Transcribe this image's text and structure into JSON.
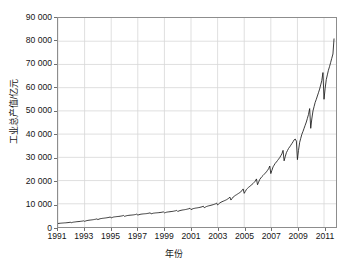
{
  "chart_data": {
    "type": "line",
    "title": "",
    "subtitle": "",
    "xlabel": "年份",
    "ylabel": "工业总产值/亿元",
    "xlim": [
      1991.0,
      2011.9
    ],
    "ylim": [
      0,
      90000
    ],
    "grid": true,
    "legend": null,
    "legend_position": "none",
    "line_color": "#1a1a1a",
    "grid_color": "#d7d7d7",
    "frame_color": "#8d8d8d",
    "background": "#ffffff",
    "y_ticks": [
      0,
      10000,
      20000,
      30000,
      40000,
      50000,
      60000,
      70000,
      80000,
      90000
    ],
    "y_tick_labels": [
      "0",
      "10 000",
      "20 000",
      "30 000",
      "40 000",
      "50 000",
      "60 000",
      "70 000",
      "80 000",
      "90 000"
    ],
    "x_ticks": [
      1991,
      1993,
      1995,
      1997,
      1999,
      2001,
      2003,
      2005,
      2007,
      2009,
      2011
    ],
    "x_tick_labels": [
      "1991",
      "1993",
      "1995",
      "1997",
      "1999",
      "2001",
      "2003",
      "2005",
      "2007",
      "2009",
      "2011"
    ],
    "series": [
      {
        "name": "工业总产值",
        "x": [
          1991.0,
          1991.08,
          1991.17,
          1991.25,
          1991.33,
          1991.42,
          1991.5,
          1991.58,
          1991.67,
          1991.75,
          1991.83,
          1991.92,
          1992.0,
          1992.08,
          1992.17,
          1992.25,
          1992.33,
          1992.42,
          1992.5,
          1992.58,
          1992.67,
          1992.75,
          1992.83,
          1992.92,
          1993.0,
          1993.08,
          1993.17,
          1993.25,
          1993.33,
          1993.42,
          1993.5,
          1993.58,
          1993.67,
          1993.75,
          1993.83,
          1993.92,
          1994.0,
          1994.08,
          1994.17,
          1994.25,
          1994.33,
          1994.42,
          1994.5,
          1994.58,
          1994.67,
          1994.75,
          1994.83,
          1994.92,
          1995.0,
          1995.08,
          1995.17,
          1995.25,
          1995.33,
          1995.42,
          1995.5,
          1995.58,
          1995.67,
          1995.75,
          1995.83,
          1995.92,
          1996.0,
          1996.08,
          1996.17,
          1996.25,
          1996.33,
          1996.42,
          1996.5,
          1996.58,
          1996.67,
          1996.75,
          1996.83,
          1996.92,
          1997.0,
          1997.08,
          1997.17,
          1997.25,
          1997.33,
          1997.42,
          1997.5,
          1997.58,
          1997.67,
          1997.75,
          1997.83,
          1997.92,
          1998.0,
          1998.08,
          1998.17,
          1998.25,
          1998.33,
          1998.42,
          1998.5,
          1998.58,
          1998.67,
          1998.75,
          1998.83,
          1998.92,
          1999.0,
          1999.08,
          1999.17,
          1999.25,
          1999.33,
          1999.42,
          1999.5,
          1999.58,
          1999.67,
          1999.75,
          1999.83,
          1999.92,
          2000.0,
          2000.08,
          2000.17,
          2000.25,
          2000.33,
          2000.42,
          2000.5,
          2000.58,
          2000.67,
          2000.75,
          2000.83,
          2000.92,
          2001.0,
          2001.08,
          2001.17,
          2001.25,
          2001.33,
          2001.42,
          2001.5,
          2001.58,
          2001.67,
          2001.75,
          2001.83,
          2001.92,
          2002.0,
          2002.08,
          2002.17,
          2002.25,
          2002.33,
          2002.42,
          2002.5,
          2002.58,
          2002.67,
          2002.75,
          2002.83,
          2002.92,
          2003.0,
          2003.08,
          2003.17,
          2003.25,
          2003.33,
          2003.42,
          2003.5,
          2003.58,
          2003.67,
          2003.75,
          2003.83,
          2003.92,
          2004.0,
          2004.08,
          2004.17,
          2004.25,
          2004.33,
          2004.42,
          2004.5,
          2004.58,
          2004.67,
          2004.75,
          2004.83,
          2004.92,
          2005.0,
          2005.08,
          2005.17,
          2005.25,
          2005.33,
          2005.42,
          2005.5,
          2005.58,
          2005.67,
          2005.75,
          2005.83,
          2005.92,
          2006.0,
          2006.08,
          2006.17,
          2006.25,
          2006.33,
          2006.42,
          2006.5,
          2006.58,
          2006.67,
          2006.75,
          2006.83,
          2006.92,
          2007.0,
          2007.08,
          2007.17,
          2007.25,
          2007.33,
          2007.42,
          2007.5,
          2007.58,
          2007.67,
          2007.75,
          2007.83,
          2007.92,
          2008.0,
          2008.08,
          2008.17,
          2008.25,
          2008.33,
          2008.42,
          2008.5,
          2008.58,
          2008.67,
          2008.75,
          2008.83,
          2008.92,
          2009.0,
          2009.08,
          2009.17,
          2009.25,
          2009.33,
          2009.42,
          2009.5,
          2009.58,
          2009.67,
          2009.75,
          2009.83,
          2009.92,
          2010.0,
          2010.08,
          2010.17,
          2010.25,
          2010.33,
          2010.42,
          2010.5,
          2010.58,
          2010.67,
          2010.75,
          2010.83,
          2010.92,
          2011.0,
          2011.08,
          2011.17,
          2011.25,
          2011.33,
          2011.42,
          2011.5,
          2011.58,
          2011.67,
          2011.75
        ],
        "values": [
          1500,
          1560,
          1620,
          1660,
          1700,
          1740,
          1780,
          1800,
          1850,
          1900,
          1950,
          2050,
          1850,
          1980,
          2100,
          2160,
          2220,
          2280,
          2320,
          2360,
          2420,
          2480,
          2540,
          2650,
          2450,
          2600,
          2760,
          2840,
          2920,
          2980,
          3040,
          3100,
          3180,
          3260,
          3340,
          3480,
          3200,
          3380,
          3560,
          3640,
          3720,
          3780,
          3840,
          3900,
          3980,
          4060,
          4140,
          4300,
          3950,
          4100,
          4280,
          4360,
          4420,
          4480,
          4520,
          4570,
          4640,
          4720,
          4800,
          4980,
          4600,
          4720,
          4880,
          4960,
          5020,
          5080,
          5120,
          5160,
          5220,
          5300,
          5380,
          5540,
          5150,
          5280,
          5440,
          5520,
          5580,
          5640,
          5680,
          5720,
          5780,
          5860,
          5940,
          6100,
          5700,
          5800,
          5940,
          6000,
          6060,
          6100,
          6140,
          6180,
          6240,
          6300,
          6380,
          6520,
          6100,
          6220,
          6380,
          6460,
          6520,
          6580,
          6640,
          6700,
          6780,
          6880,
          6980,
          7180,
          6700,
          6880,
          7080,
          7180,
          7280,
          7360,
          7440,
          7520,
          7620,
          7740,
          7860,
          8080,
          7500,
          7700,
          7920,
          8020,
          8120,
          8200,
          8280,
          8360,
          8460,
          8580,
          8700,
          8960,
          8300,
          8560,
          8840,
          8980,
          9120,
          9240,
          9360,
          9480,
          9620,
          9780,
          9940,
          10300,
          9500,
          9900,
          10400,
          10650,
          10900,
          11100,
          11300,
          11500,
          11750,
          12050,
          12350,
          12900,
          11600,
          12200,
          12900,
          13250,
          13600,
          13900,
          14200,
          14500,
          14850,
          15250,
          15650,
          16400,
          14500,
          15300,
          16200,
          16650,
          17100,
          17500,
          17900,
          18300,
          18750,
          19250,
          19750,
          20700,
          18200,
          19300,
          20500,
          21100,
          21700,
          22200,
          22700,
          23200,
          23750,
          24400,
          25050,
          26250,
          23000,
          24400,
          25900,
          26650,
          27400,
          28000,
          28600,
          29200,
          29900,
          30700,
          31500,
          33000,
          28500,
          30200,
          32000,
          32900,
          33800,
          34500,
          35200,
          35900,
          36700,
          37500,
          37900,
          37000,
          29000,
          33000,
          36500,
          38200,
          39900,
          41200,
          42500,
          43800,
          45200,
          46800,
          48400,
          51000,
          42500,
          46500,
          50000,
          51800,
          53600,
          55000,
          56400,
          57800,
          59400,
          61200,
          63000,
          66500,
          55000,
          59500,
          63500,
          65500,
          67500,
          69200,
          70900,
          72600,
          74500,
          81000
        ]
      }
    ]
  }
}
